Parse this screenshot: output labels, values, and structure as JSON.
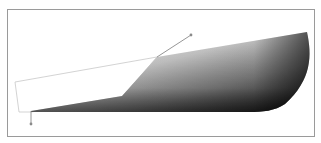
{
  "canvas": {
    "width": 321,
    "height": 143,
    "background": "#ffffff",
    "frame": {
      "x": 7,
      "y": 9,
      "width": 307,
      "height": 127,
      "stroke": "#9a9a9a"
    }
  },
  "shape": {
    "type": "gradient-filled-path",
    "gradient": {
      "direction": "radial-ish, dark at bottom-right edge, light toward upper-left",
      "stops": [
        {
          "offset": "0%",
          "color": "#ffffff"
        },
        {
          "offset": "45%",
          "color": "#b8b8b8"
        },
        {
          "offset": "100%",
          "color": "#1a1a1a"
        }
      ]
    },
    "path": "M31,111 L122,96 L157,57 L307,32 C312,55 312,80 285,104 C275,111 262,112 250,112 L31,112 Z"
  },
  "outline_polygon": {
    "points": "15,82 157,57 122,97 31,112 19,112",
    "stroke": "#c8c8c8"
  },
  "handles": [
    {
      "name": "bottom-left-handle",
      "x1": 31,
      "y1": 111,
      "x2": 31,
      "y2": 124
    },
    {
      "name": "top-handle",
      "x1": 157,
      "y1": 57,
      "x2": 191,
      "y2": 35
    }
  ],
  "handle_color": "#8a8a8a"
}
